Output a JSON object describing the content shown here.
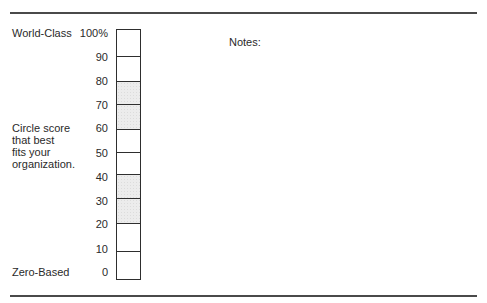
{
  "labels": {
    "top": "World-Class",
    "middle": "Circle score\nthat best\nfits your\norganization.",
    "bottom": "Zero-Based"
  },
  "notes_label": "Notes:",
  "scale": {
    "ticks": [
      "100%",
      "90",
      "80",
      "70",
      "60",
      "50",
      "40",
      "30",
      "20",
      "10",
      "0"
    ],
    "cells": [
      {
        "range": "90-100",
        "shaded": false
      },
      {
        "range": "80-90",
        "shaded": false
      },
      {
        "range": "70-80",
        "shaded": true
      },
      {
        "range": "60-70",
        "shaded": true
      },
      {
        "range": "50-60",
        "shaded": false
      },
      {
        "range": "40-50",
        "shaded": false
      },
      {
        "range": "30-40",
        "shaded": true
      },
      {
        "range": "20-30",
        "shaded": true
      },
      {
        "range": "10-20",
        "shaded": false
      },
      {
        "range": "0-10",
        "shaded": false
      }
    ]
  },
  "colors": {
    "rule": "#4a4a4a",
    "border": "#2e2e2e",
    "shade": "#ececec",
    "text": "#2a2a2a"
  }
}
